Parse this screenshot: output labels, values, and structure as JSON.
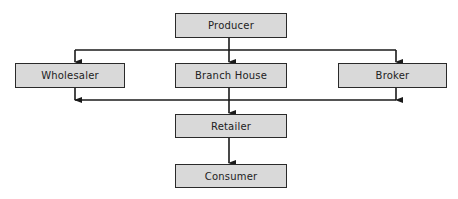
{
  "diagram": {
    "type": "flowchart",
    "title": "",
    "nodes": [
      {
        "id": "producer",
        "label": "Producer"
      },
      {
        "id": "wholesaler",
        "label": "Wholesaler"
      },
      {
        "id": "branch_house",
        "label": "Branch House"
      },
      {
        "id": "broker",
        "label": "Broker"
      },
      {
        "id": "retailer",
        "label": "Retailer"
      },
      {
        "id": "consumer",
        "label": "Consumer"
      }
    ],
    "edges": [
      {
        "from": "producer",
        "to": "wholesaler"
      },
      {
        "from": "producer",
        "to": "branch_house"
      },
      {
        "from": "producer",
        "to": "broker"
      },
      {
        "from": "wholesaler",
        "to": "retailer"
      },
      {
        "from": "branch_house",
        "to": "retailer"
      },
      {
        "from": "broker",
        "to": "retailer"
      },
      {
        "from": "retailer",
        "to": "consumer"
      }
    ],
    "colors": {
      "box_fill": "#d9d9d9",
      "stroke": "#2a2a2a"
    }
  }
}
